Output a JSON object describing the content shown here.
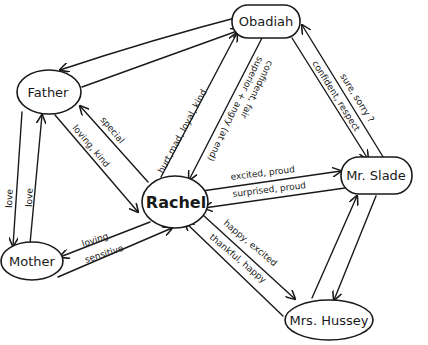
{
  "diagram": {
    "title": "",
    "type": "character relationship map",
    "nodes": [
      {
        "id": "obadiah",
        "label": "Obadiah"
      },
      {
        "id": "father",
        "label": "Father"
      },
      {
        "id": "rachel",
        "label": "Rachel"
      },
      {
        "id": "mr_slade",
        "label": "Mr. Slade"
      },
      {
        "id": "mother",
        "label": "Mother"
      },
      {
        "id": "mrs_hussey",
        "label": "Mrs. Hussey"
      }
    ],
    "edges": [
      {
        "from": "obadiah",
        "to": "father",
        "label": ""
      },
      {
        "from": "father",
        "to": "obadiah",
        "label": ""
      },
      {
        "from": "rachel",
        "to": "father",
        "label": "special"
      },
      {
        "from": "father",
        "to": "rachel",
        "label": "loving, kind"
      },
      {
        "from": "rachel",
        "to": "obadiah",
        "label": "hurt, mad, loyal, kind"
      },
      {
        "from": "obadiah",
        "to": "rachel",
        "label": "superior + angry (at end)"
      },
      {
        "from": "obadiah",
        "to": "rachel",
        "label": "confident, fair"
      },
      {
        "from": "obadiah",
        "to": "mr_slade",
        "label": "confident, respect"
      },
      {
        "from": "mr_slade",
        "to": "obadiah",
        "label": "sure, sorry ?"
      },
      {
        "from": "rachel",
        "to": "mr_slade",
        "label": "excited, proud"
      },
      {
        "from": "mr_slade",
        "to": "rachel",
        "label": "surprised, proud"
      },
      {
        "from": "rachel",
        "to": "mrs_hussey",
        "label": "happy, excited"
      },
      {
        "from": "mrs_hussey",
        "to": "rachel",
        "label": "thankful, happy"
      },
      {
        "from": "father",
        "to": "mother",
        "label": "love"
      },
      {
        "from": "mother",
        "to": "father",
        "label": "love"
      },
      {
        "from": "rachel",
        "to": "mother",
        "label": "loving"
      },
      {
        "from": "mother",
        "to": "rachel",
        "label": "sensitive"
      },
      {
        "from": "mr_slade",
        "to": "mrs_hussey",
        "label": ""
      },
      {
        "from": "mrs_hussey",
        "to": "mr_slade",
        "label": ""
      }
    ]
  },
  "labels": {
    "obadiah": "Obadiah",
    "father": "Father",
    "rachel": "Rachel",
    "mr_slade": "Mr. Slade",
    "mother": "Mother",
    "mrs_hussey": "Mrs. Hussey",
    "special": "special",
    "loving_kind": "loving, kind",
    "hurt_mad_loyal_kind": "hurt,mad, loyal, kind",
    "superior_angry": "superior + angry (at end)",
    "confident_fair": "confident, fair",
    "confident_respect": "confident, respect",
    "sure_sorry": "sure, sorry ?",
    "excited_proud": "excited, proud",
    "surprised_proud": "surprised, proud",
    "happy_excited": "happy, excited",
    "thankful_happy": "thankful, happy",
    "love_down": "love",
    "love_up": "love",
    "loving": "loving",
    "sensitive": "sensitive"
  }
}
